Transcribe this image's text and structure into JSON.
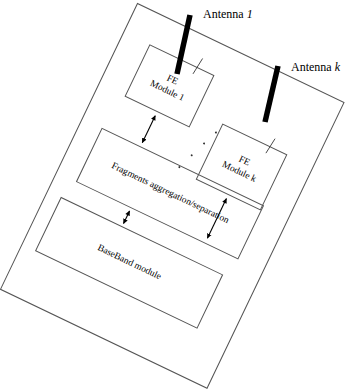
{
  "figure": {
    "type": "block-diagram",
    "rotation_degrees": 25.6,
    "line_color": "#555555",
    "antenna_color": "#000000",
    "text_color": "#000000",
    "background_color": "#ffffff"
  },
  "chassis": {
    "label": "",
    "name": "system-enclosure"
  },
  "modules": [
    {
      "id": "fe-module-1",
      "label": "FE\nModule 1",
      "line1": "FE",
      "line2": "Module 1"
    },
    {
      "id": "fe-module-k",
      "label": "FE\nModule k",
      "line1": "FE",
      "line2": "Module k"
    },
    {
      "id": "fragments-aggregation-separation",
      "label": "Fragments aggregation/separation"
    },
    {
      "id": "baseband-module",
      "label": "BaseBand module"
    }
  ],
  "antennas": [
    {
      "id": "antenna-1",
      "prefix": "Antenna ",
      "index": "1",
      "label": "Antenna 1",
      "connects_to": "fe-module-1"
    },
    {
      "id": "antenna-k",
      "prefix": "Antenna ",
      "index": "k",
      "label": "Antenna k",
      "connects_to": "fe-module-k"
    }
  ],
  "ellipsis": {
    "label": "",
    "dot_count": 4,
    "meaning": "additional front-end modules"
  },
  "connections": [
    {
      "id": "link-fe1-fragments",
      "from": "fe-module-1",
      "to": "fragments-aggregation-separation",
      "arrow": "double"
    },
    {
      "id": "link-fek-fragments",
      "from": "fe-module-k",
      "to": "fragments-aggregation-separation",
      "arrow": "double"
    },
    {
      "id": "link-fragments-baseband",
      "from": "fragments-aggregation-separation",
      "to": "baseband-module",
      "arrow": "double"
    }
  ]
}
